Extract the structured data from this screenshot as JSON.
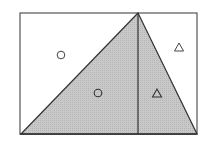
{
  "diagram": {
    "type": "geometry",
    "colors": {
      "stroke": "#3a3a3a",
      "shade": "#c4c4c4",
      "background": "#ffffff"
    },
    "rectangle": {
      "x": 20,
      "y": 13,
      "width": 177,
      "height": 121
    },
    "apex": {
      "x": 138,
      "y": 13
    },
    "base_left": {
      "x": 21,
      "y": 134
    },
    "base_right": {
      "x": 197,
      "y": 134
    },
    "markers": [
      {
        "shape": "circle",
        "x": 61,
        "y": 55,
        "region": "left-unshaded"
      },
      {
        "shape": "circle",
        "x": 98,
        "y": 93,
        "region": "left-shaded"
      },
      {
        "shape": "triangle",
        "x": 179,
        "y": 47,
        "region": "right-unshaded"
      },
      {
        "shape": "triangle",
        "x": 157,
        "y": 93,
        "region": "right-shaded"
      }
    ]
  }
}
